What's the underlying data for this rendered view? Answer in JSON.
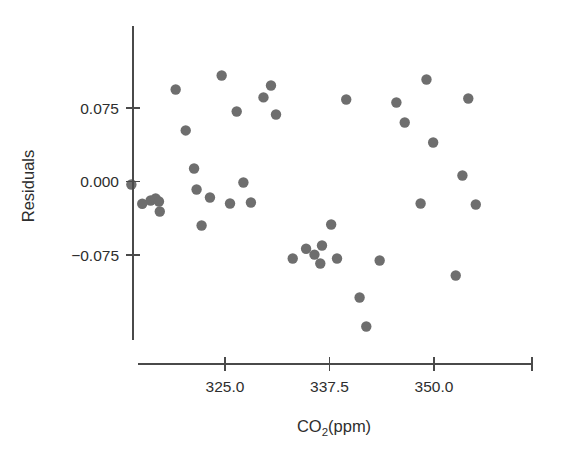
{
  "chart_data": {
    "type": "scatter",
    "title": "",
    "xlabel": "CO2(ppm)",
    "xlabel_main": "CO",
    "xlabel_sub": "2",
    "xlabel_tail": "(ppm)",
    "ylabel": "Residuals",
    "xticks": [
      325.0,
      337.5,
      350.0,
      361.7
    ],
    "xtick_labels": [
      "325.0",
      "337.5",
      "350.0",
      ""
    ],
    "yticks": [
      0.075,
      0.0,
      -0.075
    ],
    "ytick_labels": [
      "0.075",
      "0.000",
      "-0.075"
    ],
    "xlim": [
      312.8,
      364.0
    ],
    "ylim": [
      -0.128,
      0.126
    ],
    "grid": false,
    "legend": null,
    "marker_color": "#6e6e6e",
    "axis_color": "#4a4a4a",
    "background": "#ffffff",
    "marker_radius": 5.2,
    "n_points": 39,
    "points": [
      {
        "x": 313.8,
        "y": -0.0031
      },
      {
        "x": 315.1,
        "y": -0.0227
      },
      {
        "x": 316.1,
        "y": -0.0194
      },
      {
        "x": 316.7,
        "y": -0.0173
      },
      {
        "x": 317.2,
        "y": -0.0306
      },
      {
        "x": 317.1,
        "y": -0.0204
      },
      {
        "x": 319.1,
        "y": 0.0939
      },
      {
        "x": 320.3,
        "y": 0.0521
      },
      {
        "x": 321.3,
        "y": 0.0133
      },
      {
        "x": 321.6,
        "y": -0.0082
      },
      {
        "x": 322.2,
        "y": -0.0449
      },
      {
        "x": 323.2,
        "y": -0.0163
      },
      {
        "x": 324.6,
        "y": 0.1082
      },
      {
        "x": 325.6,
        "y": -0.0224
      },
      {
        "x": 326.4,
        "y": 0.0714
      },
      {
        "x": 327.2,
        "y": -0.001
      },
      {
        "x": 328.1,
        "y": -0.0214
      },
      {
        "x": 329.6,
        "y": 0.0858
      },
      {
        "x": 330.5,
        "y": 0.098
      },
      {
        "x": 331.1,
        "y": 0.0684
      },
      {
        "x": 333.1,
        "y": -0.0786
      },
      {
        "x": 334.7,
        "y": -0.0686
      },
      {
        "x": 335.7,
        "y": -0.0746
      },
      {
        "x": 336.4,
        "y": -0.0837
      },
      {
        "x": 336.6,
        "y": -0.0653
      },
      {
        "x": 337.7,
        "y": -0.0439
      },
      {
        "x": 338.4,
        "y": -0.0786
      },
      {
        "x": 339.5,
        "y": 0.0837
      },
      {
        "x": 341.1,
        "y": -0.1184
      },
      {
        "x": 341.9,
        "y": -0.148
      },
      {
        "x": 343.5,
        "y": -0.0806
      },
      {
        "x": 345.5,
        "y": 0.0806
      },
      {
        "x": 346.5,
        "y": 0.0602
      },
      {
        "x": 348.4,
        "y": -0.0224
      },
      {
        "x": 349.1,
        "y": 0.1041
      },
      {
        "x": 349.9,
        "y": 0.0398
      },
      {
        "x": 352.6,
        "y": -0.0959
      },
      {
        "x": 353.4,
        "y": 0.0061
      },
      {
        "x": 354.1,
        "y": 0.0847
      },
      {
        "x": 355.0,
        "y": -0.0235
      }
    ]
  },
  "axes": {
    "x_axis_name": "x-axis",
    "y_axis_name": "y-axis"
  }
}
